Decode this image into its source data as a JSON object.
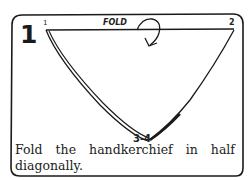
{
  "card": {
    "step_number": "1",
    "corner_labels": {
      "top_left": "1",
      "top_right": "2",
      "bottom": "3-4"
    },
    "fold_label": "FOLD",
    "caption": "Fold the handkerchief in half diagonally."
  },
  "colors": {
    "ink": "#1a1a1a",
    "background": "#ffffff"
  }
}
